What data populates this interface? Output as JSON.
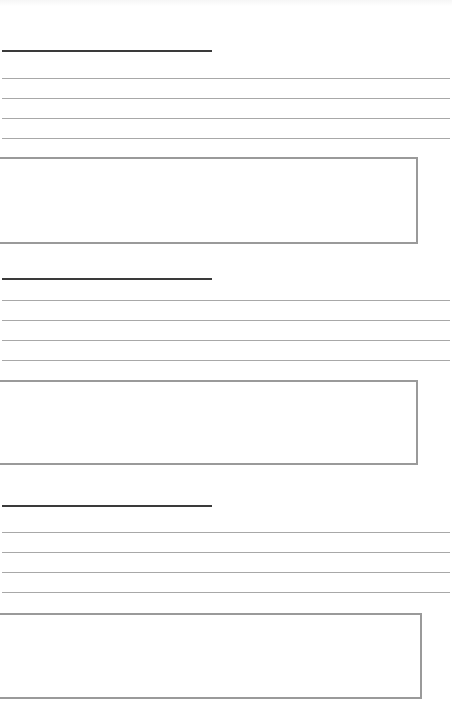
{
  "page": {
    "background": "#ffffff",
    "heading_line_color": "#3a3a3a",
    "ruled_line_color": "#a8a8a8",
    "box_border_color": "#9a9a9a"
  },
  "sections": [
    {
      "heading": {
        "value": "",
        "line_y": 50
      },
      "lines": [
        {
          "value": "",
          "y": 78
        },
        {
          "value": "",
          "y": 98
        },
        {
          "value": "",
          "y": 118
        },
        {
          "value": "",
          "y": 138
        }
      ],
      "box": {
        "value": "",
        "top": 157,
        "height": 87
      }
    },
    {
      "heading": {
        "value": "",
        "line_y": 278
      },
      "lines": [
        {
          "value": "",
          "y": 300
        },
        {
          "value": "",
          "y": 320
        },
        {
          "value": "",
          "y": 340
        },
        {
          "value": "",
          "y": 360
        }
      ],
      "box": {
        "value": "",
        "top": 380,
        "height": 85
      }
    },
    {
      "heading": {
        "value": "",
        "line_y": 505
      },
      "lines": [
        {
          "value": "",
          "y": 532
        },
        {
          "value": "",
          "y": 552
        },
        {
          "value": "",
          "y": 572
        },
        {
          "value": "",
          "y": 592
        }
      ],
      "box": {
        "value": "",
        "top": 613,
        "height": 86
      }
    }
  ]
}
